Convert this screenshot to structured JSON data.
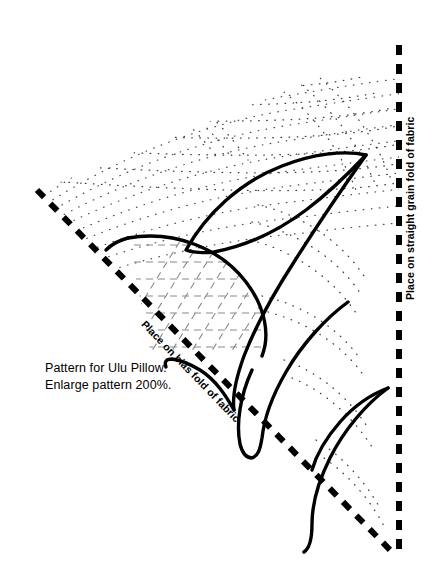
{
  "page": {
    "background_color": "#ffffff",
    "ink_color": "#000000",
    "width": 431,
    "height": 577
  },
  "caption": {
    "line1": "Pattern for Ulu Pillow.",
    "line2": "Enlarge pattern 200%."
  },
  "labels": {
    "straight_grain": "Place on straight grain fold of fabric",
    "bias_fold": "Place on bias fold of fabric"
  },
  "diagram": {
    "type": "quilting-pattern",
    "fold_lines": [
      {
        "name": "straight-grain-fold",
        "orientation": "vertical",
        "style": "heavy-dashed",
        "from": [
          399,
          45
        ],
        "to": [
          399,
          556
        ]
      },
      {
        "name": "bias-fold",
        "orientation": "diagonal",
        "style": "heavy-dashed",
        "from": [
          37,
          190
        ],
        "to": [
          396,
          556
        ]
      }
    ],
    "motifs": [
      "upper-leaf-blade",
      "inner-leaf-blade",
      "middle-hook-petal",
      "lower-hook-petal",
      "center-rosette-arc"
    ],
    "fills": [
      {
        "name": "crosshatch-quilting",
        "style": "dashed-grid"
      },
      {
        "name": "echo-quilting-dots",
        "style": "dotted-contour-arcs"
      }
    ]
  }
}
